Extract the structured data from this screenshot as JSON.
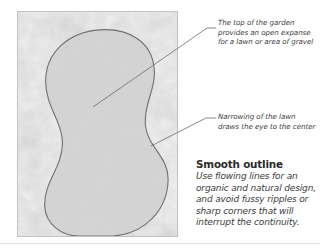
{
  "figure": {
    "name": "smooth-outline-garden-lawn-diagram",
    "background_color": "#ffffff"
  },
  "panel": {
    "border_color": "#c2c2c2",
    "texture_description": "mottled gray gravel texture",
    "texture_base_color": "#e9e9e9",
    "shape": {
      "name": "lawn-outline",
      "fill_color": "#d0d0d0",
      "stroke_color": "#6f6f6f",
      "description": "smooth flowing peanut-shaped lawn with a wide top lobe, a narrow waist and a wide bottom lobe"
    }
  },
  "callouts": [
    {
      "id": "top-of-garden",
      "text": "The top of the garden provides an open expanse for a lawn or area of gravel"
    },
    {
      "id": "narrowing-of-lawn",
      "text": "Narrowing of the lawn draws the eye to the center"
    }
  ],
  "caption": {
    "title": "Smooth outline",
    "body": "Use flowing lines for an organic and natural design, and avoid fussy ripples or sharp corners that will interrupt the continuity."
  },
  "colors": {
    "text": "#3b3b3b",
    "title": "#2b2b2b",
    "leader_line": "#6b6b6b",
    "divider": "#e3e3e3"
  }
}
